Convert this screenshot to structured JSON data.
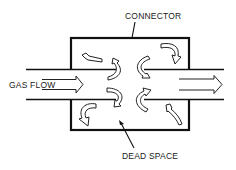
{
  "diagram": {
    "labels": {
      "connector": "CONNECTOR",
      "gas_flow": "GAS FLOW",
      "dead_space": "DEAD SPACE"
    },
    "components": [
      "inlet pipe",
      "connector chamber",
      "outlet pipe"
    ],
    "flow_direction": "left-to-right",
    "eddy_arrow_count": 8,
    "colors": {
      "line": "#111111",
      "background": "#ffffff"
    }
  }
}
